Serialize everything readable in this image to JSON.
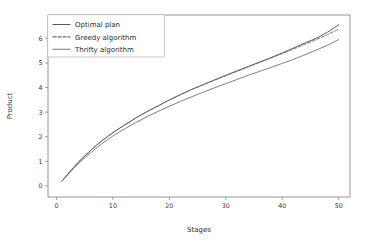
{
  "chart_data": {
    "type": "line",
    "title": "",
    "subtitle": "",
    "xlabel": "Stages",
    "ylabel": "Product",
    "xlim": [
      -1.5,
      52
    ],
    "ylim": [
      -0.45,
      6.95
    ],
    "xticks": [
      0,
      10,
      20,
      30,
      40,
      50
    ],
    "xticklabels": [
      "0",
      "10",
      "20",
      "30",
      "40",
      "50"
    ],
    "yticks": [
      0,
      1,
      2,
      3,
      4,
      5,
      6
    ],
    "yticklabels": [
      "0",
      "1",
      "2",
      "3",
      "4",
      "5",
      "6"
    ],
    "grid": false,
    "legend_position": "upper left",
    "x": [
      1,
      2,
      3,
      4,
      5,
      6,
      7,
      8,
      9,
      10,
      12,
      14,
      16,
      18,
      20,
      22,
      24,
      26,
      28,
      30,
      32,
      34,
      36,
      38,
      40,
      42,
      44,
      46,
      48,
      50
    ],
    "series": [
      {
        "name": "Optimal plan",
        "linestyle": "solid",
        "color": "#5a5a5a",
        "values": [
          0.2,
          0.48,
          0.75,
          1.0,
          1.22,
          1.44,
          1.64,
          1.83,
          2.0,
          2.17,
          2.47,
          2.76,
          3.02,
          3.26,
          3.5,
          3.72,
          3.93,
          4.12,
          4.31,
          4.5,
          4.68,
          4.86,
          5.04,
          5.22,
          5.41,
          5.61,
          5.81,
          6.0,
          6.25,
          6.55
        ]
      },
      {
        "name": "Greedy algorithm",
        "linestyle": "dashed",
        "color": "#6e6e6e",
        "values": [
          0.2,
          0.48,
          0.74,
          0.99,
          1.21,
          1.43,
          1.63,
          1.82,
          1.99,
          2.16,
          2.46,
          2.75,
          3.01,
          3.25,
          3.49,
          3.71,
          3.92,
          4.11,
          4.3,
          4.48,
          4.66,
          4.84,
          5.02,
          5.2,
          5.38,
          5.57,
          5.76,
          5.95,
          6.15,
          6.38
        ]
      },
      {
        "name": "Thrifty algorithm",
        "linestyle": "solid",
        "color": "#787878",
        "values": [
          0.2,
          0.45,
          0.7,
          0.93,
          1.14,
          1.34,
          1.53,
          1.71,
          1.87,
          2.03,
          2.31,
          2.57,
          2.81,
          3.03,
          3.24,
          3.44,
          3.63,
          3.81,
          3.99,
          4.16,
          4.33,
          4.5,
          4.66,
          4.82,
          4.98,
          5.15,
          5.33,
          5.52,
          5.72,
          5.95
        ]
      }
    ]
  },
  "legend": {
    "entries": [
      {
        "label": "Optimal plan"
      },
      {
        "label": "Greedy algorithm"
      },
      {
        "label": "Thrifty algorithm"
      }
    ]
  },
  "axes": {
    "xlabel": "Stages",
    "ylabel": "Product"
  }
}
